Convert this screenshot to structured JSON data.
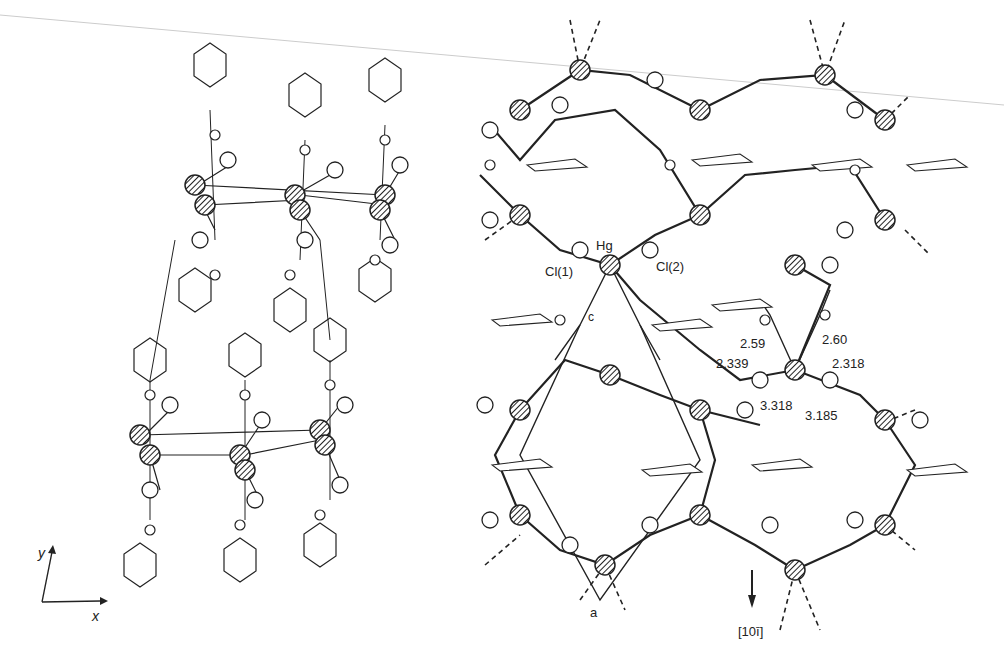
{
  "left_panel": {
    "axes": {
      "x_label": "x",
      "y_label": "y"
    }
  },
  "right_panel": {
    "atom_labels": {
      "hg": "Hg",
      "cl1": "Cl(1)",
      "cl2": "Cl(2)"
    },
    "cell_labels": {
      "c": "c",
      "a": "a"
    },
    "distances": {
      "d1": "2.59",
      "d2": "2.60",
      "d3": "2.339",
      "d4": "2.318",
      "d5": "3.318",
      "d6": "3.185"
    },
    "direction": "[10ī]"
  },
  "colors": {
    "line": "#222222",
    "background": "#ffffff"
  }
}
